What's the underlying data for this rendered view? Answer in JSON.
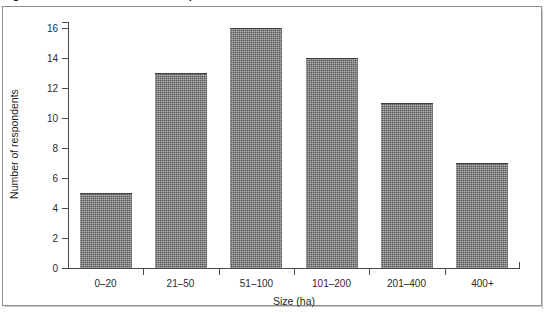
{
  "figure": {
    "caption": "Figure 4: Farm Size Profile of Respondents"
  },
  "chart_data": {
    "type": "bar",
    "title": "Figure 4: Farm Size Profile of Respondents",
    "xlabel": "Size (ha)",
    "ylabel": "Number of respondents",
    "categories": [
      "0–20",
      "21–50",
      "51–100",
      "101–200",
      "201–400",
      "400+"
    ],
    "values": [
      5,
      13,
      16,
      14,
      11,
      7
    ],
    "ylim": [
      0,
      16
    ],
    "ytick_labels": [
      "0",
      "2",
      "4",
      "6",
      "8",
      "10",
      "12",
      "14",
      "16"
    ],
    "ytick_values": [
      0,
      2,
      4,
      6,
      8,
      10,
      12,
      14,
      16
    ],
    "grid": false,
    "legend": false,
    "bar_color": "#5b5b5b",
    "axis_color": "#4a4a4a",
    "frame_color": "#8d8d8d",
    "background": "#ffffff"
  }
}
